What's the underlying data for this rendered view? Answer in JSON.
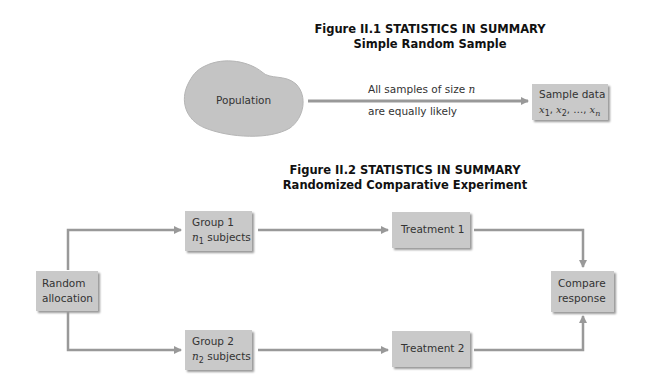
{
  "figure1": {
    "title_line1": "Figure II.1 STATISTICS IN SUMMARY",
    "title_line2": "Simple Random Sample",
    "population_label": "Population",
    "arrow_label_line1": "All samples of size",
    "arrow_label_var": "n",
    "arrow_label_line2": "are equally likely",
    "sample_box": {
      "line1": "Sample data",
      "line2_var": "x",
      "subscripts": [
        "1",
        "2",
        "n"
      ],
      "separator": ", ",
      "ellipsis": "…, "
    }
  },
  "figure2": {
    "title_line1": "Figure II.2 STATISTICS IN SUMMARY",
    "title_line2": "Randomized Comparative Experiment",
    "random_allocation": {
      "line1": "Random",
      "line2": "allocation"
    },
    "group1": {
      "line1": "Group 1",
      "var": "n",
      "sub": "1",
      "suffix": " subjects"
    },
    "group2": {
      "line1": "Group 2",
      "var": "n",
      "sub": "2",
      "suffix": " subjects"
    },
    "treatment1": "Treatment 1",
    "treatment2": "Treatment 2",
    "compare": {
      "line1": "Compare",
      "line2": "response"
    }
  },
  "colors": {
    "box_fill": "#c9c9c9",
    "arrow": "#999999",
    "text": "#333333"
  }
}
